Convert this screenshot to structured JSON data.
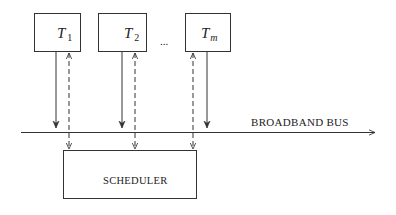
{
  "diagram": {
    "terminals": [
      {
        "id": "T1",
        "symbol": "T",
        "subscript": "1"
      },
      {
        "id": "T2",
        "symbol": "T",
        "subscript": "2"
      },
      {
        "id": "Tm",
        "symbol": "T",
        "subscript": "m"
      }
    ],
    "ellipsis": "...",
    "bus_label": "BROADBAND BUS",
    "scheduler_label": "SCHEDULER",
    "colors": {
      "stroke": "#333333",
      "background": "#ffffff"
    }
  }
}
